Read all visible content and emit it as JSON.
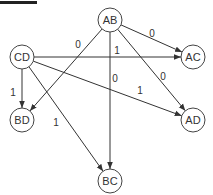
{
  "diagram": {
    "type": "directed-graph",
    "nodes": [
      {
        "id": "AB",
        "label": "AB"
      },
      {
        "id": "CD",
        "label": "CD"
      },
      {
        "id": "AC",
        "label": "AC"
      },
      {
        "id": "BD",
        "label": "BD"
      },
      {
        "id": "AD",
        "label": "AD"
      },
      {
        "id": "BC",
        "label": "BC"
      }
    ],
    "edges": [
      {
        "from": "AB",
        "to": "AC",
        "label": "0"
      },
      {
        "from": "AB",
        "to": "BD",
        "label": "0"
      },
      {
        "from": "AB",
        "to": "BC",
        "label": "0"
      },
      {
        "from": "AB",
        "to": "AD",
        "label": "0"
      },
      {
        "from": "CD",
        "to": "AC",
        "label": "1"
      },
      {
        "from": "CD",
        "to": "AD",
        "label": "1"
      },
      {
        "from": "CD",
        "to": "BD",
        "label": "1"
      },
      {
        "from": "CD",
        "to": "BC",
        "label": "1"
      }
    ]
  }
}
